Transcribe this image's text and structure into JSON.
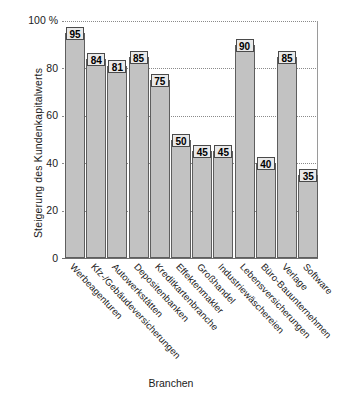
{
  "chart_data": {
    "type": "bar",
    "title": "",
    "xlabel": "Branchen",
    "ylabel": "Steigerung des Kundenkapitalwerts",
    "ylim": [
      0,
      100
    ],
    "yticks": [
      "0",
      "20",
      "40",
      "60",
      "80",
      "100 %"
    ],
    "grid": true,
    "legend": "none",
    "unit": "%",
    "categories": [
      "Werbeagenturen",
      "Kfz-/Gebäudeversicherungen",
      "Autowerkstätten",
      "Depositenbanken",
      "Kreditkartenbranche",
      "Effektenmakler",
      "Großhandel",
      "Industriewäschereien",
      "Lebensversicherungen",
      "Büro-Bauunternehmen",
      "Verlage",
      "Software"
    ],
    "values": [
      95,
      84,
      81,
      85,
      75,
      50,
      45,
      45,
      90,
      40,
      85,
      35
    ],
    "bar_fill_color": "#c2c2c2",
    "bar_edge_color": "#5e5e5e",
    "gridline_color": "#8a8a8a",
    "background_color": "#ffffff"
  }
}
